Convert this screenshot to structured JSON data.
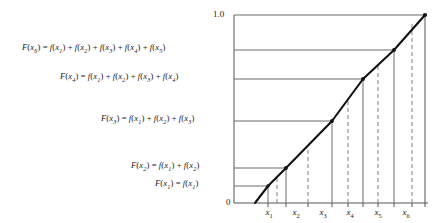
{
  "figure": {
    "title_text": "",
    "axes": {
      "y_top_label": "1.0",
      "y_bottom_label": "0",
      "x_tick_labels": [
        "x1",
        "x2",
        "x3",
        "x4",
        "x5",
        "x6"
      ],
      "x_tick_bases": [
        "x",
        "x",
        "x",
        "x",
        "x",
        "x"
      ],
      "x_tick_subs": [
        "1",
        "2",
        "3",
        "4",
        "5",
        "6"
      ]
    },
    "equations": [
      {
        "name": "eq-F6",
        "lhs_base": "F",
        "lhs_sub": "6",
        "text": "F(x6) = f(x1) + f(x2) + f(x3) + f(x4) + f(x5)",
        "terms": [
          "f(x1)",
          "f(x2)",
          "f(x3)",
          "f(x4)",
          "f(x5)"
        ]
      },
      {
        "name": "eq-F4",
        "lhs_base": "F",
        "lhs_sub": "4",
        "text": "F(x4) = f(x1) + f(x2) + f(x3) + f(x4)",
        "terms": [
          "f(x1)",
          "f(x2)",
          "f(x3)",
          "f(x4)"
        ]
      },
      {
        "name": "eq-F3",
        "lhs_base": "F",
        "lhs_sub": "3",
        "text": "F(x3) = f(x1) + f(x2) + f(x3)",
        "terms": [
          "f(x1)",
          "f(x2)",
          "f(x3)"
        ]
      },
      {
        "name": "eq-F2",
        "lhs_base": "F",
        "lhs_sub": "2",
        "text": "F(x2) = f(x1) + f(x2)",
        "terms": [
          "f(x1)",
          "f(x2)"
        ]
      },
      {
        "name": "eq-F1",
        "lhs_base": "F",
        "lhs_sub": "1",
        "text": "F(x1) = f(x1)",
        "terms": [
          "f(x1)"
        ]
      }
    ]
  },
  "chart_data": {
    "type": "line",
    "title": "",
    "xlabel": "",
    "ylabel": "",
    "xlim": [
      0,
      7
    ],
    "ylim": [
      0,
      1.0
    ],
    "grid": false,
    "legend_position": "none",
    "y_tick_labels": [
      "0",
      "1.0"
    ],
    "y_tick_values": [
      0,
      1.0
    ],
    "x_tick_labels": [
      "x1",
      "x2",
      "x3",
      "x4",
      "x5",
      "x6"
    ],
    "x_tick_values": [
      1,
      2,
      3,
      4,
      5,
      6
    ],
    "series": [
      {
        "name": "cumulative distribution F(x)",
        "x": [
          0.45,
          1.0,
          2.0,
          3.0,
          4.0,
          5.0,
          6.0
        ],
        "y": [
          0.0,
          0.085,
          0.185,
          0.42,
          0.66,
          0.83,
          1.0
        ],
        "marked_points": [
          {
            "label": "F(x1)",
            "x": 1.0,
            "y": 0.085
          },
          {
            "label": "F(x2)",
            "x": 2.0,
            "y": 0.185
          },
          {
            "label": "F(x3)",
            "x": 3.0,
            "y": 0.42
          },
          {
            "label": "F(x4)",
            "x": 4.0,
            "y": 0.66
          },
          {
            "label": "F(x5)",
            "x": 5.0,
            "y": 0.83
          },
          {
            "label": "F(x6)",
            "x": 6.0,
            "y": 1.0
          }
        ]
      }
    ],
    "horizontal_leader_lines_y": [
      0.085,
      0.185,
      0.42,
      0.66,
      1.0
    ],
    "solid_droplines_x": [
      1,
      2,
      3,
      4,
      5,
      6
    ],
    "dashed_droplines_x": [
      1.5,
      2.5,
      3.5,
      4.5,
      5.5,
      6.5
    ],
    "annotations": [
      "F(x6) = f(x1) + f(x2) + f(x3) + f(x4) + f(x5)",
      "F(x4) = f(x1) + f(x2) + f(x3) + f(x4)",
      "F(x3) = f(x1) + f(x2) + f(x3)",
      "F(x2) = f(x1) + f(x2)",
      "F(x1) = f(x1)"
    ]
  }
}
